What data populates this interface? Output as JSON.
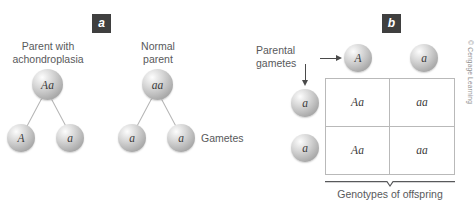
{
  "figure": {
    "background_color": "#ffffff",
    "credit": "© Cengage Learning"
  },
  "panel_a": {
    "badge": "a",
    "parent_left": {
      "caption": "Parent with\nachondroplasia",
      "genotype": "Aa",
      "gametes": [
        "A",
        "a"
      ]
    },
    "parent_right": {
      "caption": "Normal\nparent",
      "genotype": "aa",
      "gametes": [
        "a",
        "a"
      ]
    },
    "gametes_label": "Gametes"
  },
  "panel_b": {
    "badge": "b",
    "parental_gametes_label": "Parental\ngametes",
    "top_gametes": [
      "A",
      "a"
    ],
    "side_gametes": [
      "a",
      "a"
    ],
    "offspring_label": "Genotypes of offspring",
    "punnett": {
      "rows": [
        [
          "Aa",
          "aa"
        ],
        [
          "Aa",
          "aa"
        ]
      ]
    }
  },
  "colors": {
    "badge_bg": "#3f3f3f",
    "badge_text": "#ffffff",
    "caption_text": "#58595b",
    "grid_line": "#b9b9b9",
    "arrow": "#4a4a4a",
    "sphere_text": "#3a3a3a"
  }
}
